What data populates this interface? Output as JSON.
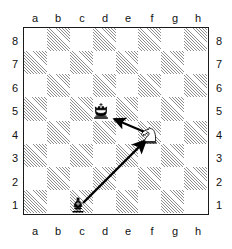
{
  "diagram": {
    "type": "chess-board-diagram",
    "title": "",
    "orientation": "white-bottom",
    "board": {
      "files": [
        "a",
        "b",
        "c",
        "d",
        "e",
        "f",
        "g",
        "h"
      ],
      "ranks": [
        "8",
        "7",
        "6",
        "5",
        "4",
        "3",
        "2",
        "1"
      ],
      "squares": 64,
      "dark_square_style": "diagonal-hatch",
      "light_square_color": "#ffffff",
      "dark_square_color": "#8e8e8e",
      "border_color": "#1a1a1a"
    },
    "labels": {
      "files_top": [
        "a",
        "b",
        "c",
        "d",
        "e",
        "f",
        "g",
        "h"
      ],
      "files_bottom": [
        "a",
        "b",
        "c",
        "d",
        "e",
        "f",
        "g",
        "h"
      ],
      "ranks_left": [
        "8",
        "7",
        "6",
        "5",
        "4",
        "3",
        "2",
        "1"
      ],
      "ranks_right": [
        "8",
        "7",
        "6",
        "5",
        "4",
        "3",
        "2",
        "1"
      ]
    },
    "pieces": [
      {
        "id": "black-king",
        "piece": "king",
        "color": "black",
        "square": "d5",
        "file": "d",
        "rank": "5",
        "symbol": "♚"
      },
      {
        "id": "white-knight",
        "piece": "knight",
        "color": "white",
        "square": "f4",
        "file": "f",
        "rank": "4",
        "symbol": "♘"
      },
      {
        "id": "black-bishop",
        "piece": "bishop",
        "color": "black",
        "square": "c1",
        "file": "c",
        "rank": "1",
        "symbol": "♝"
      }
    ],
    "arrows": [
      {
        "id": "arrow-bishop-to-knight",
        "from": "c1",
        "to": "f4",
        "color": "#000000",
        "label": ""
      },
      {
        "id": "arrow-knight-to-king",
        "from": "f4",
        "to": "d5",
        "color": "#000000",
        "label": ""
      }
    ]
  }
}
